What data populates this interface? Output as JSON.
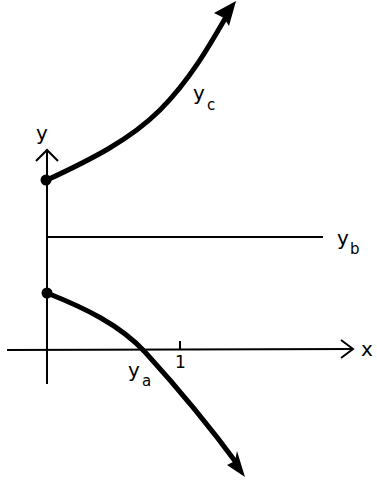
{
  "diagram": {
    "type": "function-graph-sketch",
    "axes": {
      "x_label": "x",
      "y_label": "y",
      "x_tick_label": "1"
    },
    "curves": [
      {
        "id": "yc",
        "label": "y",
        "subscript": "c",
        "description": "increasing curve starting at upper point on y-axis"
      },
      {
        "id": "yb",
        "label": "y",
        "subscript": "b",
        "description": "horizontal line (constant)"
      },
      {
        "id": "ya",
        "label": "y",
        "subscript": "a",
        "description": "decreasing curve starting at lower point on y-axis, crossing x-axis before x=1"
      }
    ],
    "colors": {
      "ink": "#000000",
      "background": "#ffffff"
    }
  }
}
